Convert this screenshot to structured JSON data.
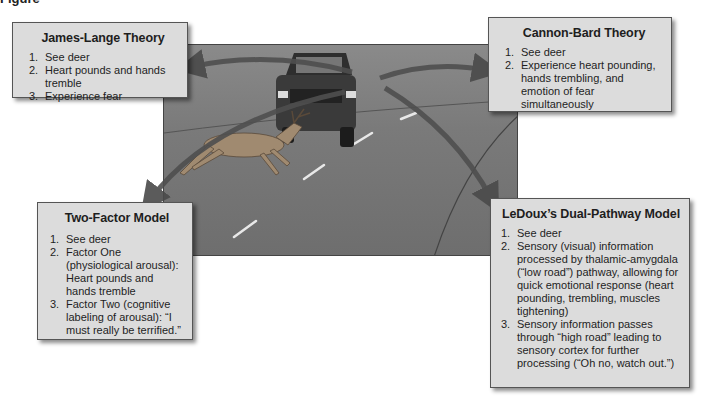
{
  "caption": "Figure",
  "scene": {
    "description": "Deer leaping across a road in front of an oncoming truck",
    "colors": {
      "road": "#7a7a7a",
      "arrow": "#555555",
      "box_fill": "#dcdcdc"
    }
  },
  "boxes": {
    "james_lange": {
      "title": "James-Lange Theory",
      "items": [
        {
          "num": "1.",
          "text": "See deer"
        },
        {
          "num": "2.",
          "text": "Heart pounds and hands tremble"
        },
        {
          "num": "3.",
          "text": "Experience fear"
        }
      ]
    },
    "cannon_bard": {
      "title": "Cannon-Bard Theory",
      "items": [
        {
          "num": "1.",
          "text": "See deer"
        },
        {
          "num": "2.",
          "text": "Experience heart pounding, hands trembling, and emotion of fear simultaneously"
        }
      ]
    },
    "two_factor": {
      "title": "Two-Factor Model",
      "items": [
        {
          "num": "1.",
          "text": "See deer"
        },
        {
          "num": "2.",
          "text": "Factor One (physiological arousal): Heart pounds and hands tremble"
        },
        {
          "num": "3.",
          "text": "Factor Two (cognitive labeling of arousal): “I must really be terrified.”"
        }
      ]
    },
    "ledoux": {
      "title": "LeDoux’s Dual-Pathway Model",
      "items": [
        {
          "num": "1.",
          "text": "See deer"
        },
        {
          "num": "2.",
          "text": "Sensory (visual) information processed by thalamic-amygdala (“low road”) pathway, allowing for quick emotional response (heart pounding, trembling, muscles tightening)"
        },
        {
          "num": "3.",
          "text": "Sensory information passes through “high road” leading to sensory cortex for further processing (“Oh no, watch out.”)"
        }
      ]
    }
  }
}
